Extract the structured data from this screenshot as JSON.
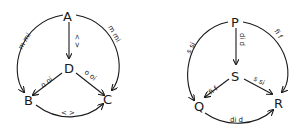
{
  "diagrams": [
    {
      "name": "left",
      "nodes": {
        "top": "A",
        "center": "D",
        "left": "B",
        "right": "C"
      },
      "edges": {
        "top_center": "< >",
        "top_left": "m mi",
        "top_right": "m mi",
        "center_left": "o oi",
        "center_right": "o oi",
        "left_right": "< >"
      }
    },
    {
      "name": "right",
      "nodes": {
        "top": "P",
        "center": "S",
        "left": "Q",
        "right": "R"
      },
      "edges": {
        "top_center": "di d",
        "top_left": "s si",
        "top_right": "fi f",
        "center_left": "fi f",
        "center_right": "s si",
        "left_right": "di d"
      }
    }
  ]
}
